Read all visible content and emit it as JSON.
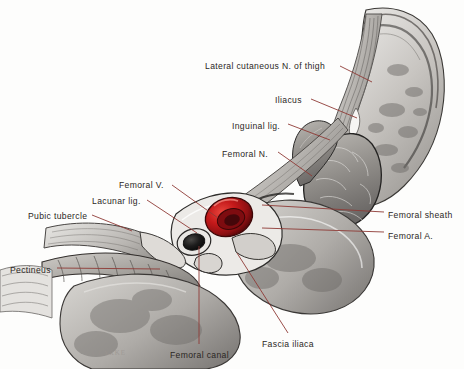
{
  "figure": {
    "background_color": "#fdfdfc",
    "leader_line_color": "#8e3a36",
    "artery_color": "#c01a18",
    "artist_signature": "CLARKE"
  },
  "labels": [
    {
      "id": "lateral-cutaneous-nerve-of-thigh",
      "text": "Lateral cutaneous N. of thigh",
      "x": 205,
      "y": 62,
      "anchor": "start",
      "leader": [
        [
          340,
          66
        ],
        [
          372,
          82
        ]
      ]
    },
    {
      "id": "iliacus",
      "text": "Iliacus",
      "x": 275,
      "y": 96,
      "anchor": "start",
      "leader": [
        [
          311,
          99
        ],
        [
          357,
          118
        ]
      ]
    },
    {
      "id": "inguinal-ligament",
      "text": "Inguinal lig.",
      "x": 232,
      "y": 122,
      "anchor": "start",
      "leader": [
        [
          288,
          124
        ],
        [
          330,
          140
        ]
      ]
    },
    {
      "id": "femoral-nerve",
      "text": "Femoral N.",
      "x": 222,
      "y": 150,
      "anchor": "start",
      "leader": [
        [
          278,
          152
        ],
        [
          312,
          176
        ]
      ]
    },
    {
      "id": "femoral-vein",
      "text": "Femoral V.",
      "x": 119,
      "y": 181,
      "anchor": "start",
      "leader": [
        [
          172,
          185
        ],
        [
          218,
          218
        ]
      ]
    },
    {
      "id": "lacunar-ligament",
      "text": "Lacunar lig.",
      "x": 92,
      "y": 197,
      "anchor": "start",
      "leader": [
        [
          147,
          200
        ],
        [
          197,
          233
        ]
      ]
    },
    {
      "id": "pubic-tubercle",
      "text": "Pubic tubercle",
      "x": 28,
      "y": 212,
      "anchor": "start",
      "leader": [
        [
          92,
          215
        ],
        [
          132,
          231
        ]
      ]
    },
    {
      "id": "pectineus",
      "text": "Pectineus",
      "x": 10,
      "y": 266,
      "anchor": "start",
      "leader": [
        [
          57,
          268
        ],
        [
          160,
          269
        ]
      ]
    },
    {
      "id": "femoral-sheath",
      "text": "Femoral sheath",
      "x": 388,
      "y": 211,
      "anchor": "start",
      "leader": [
        [
          384,
          212
        ],
        [
          262,
          205
        ]
      ]
    },
    {
      "id": "femoral-artery",
      "text": "Femoral A.",
      "x": 388,
      "y": 232,
      "anchor": "start",
      "leader": [
        [
          384,
          232
        ],
        [
          262,
          228
        ]
      ]
    },
    {
      "id": "fascia-iliaca",
      "text": "Fascia iliaca",
      "x": 262,
      "y": 340,
      "anchor": "start",
      "leader": [
        [
          288,
          333
        ],
        [
          237,
          253
        ]
      ]
    },
    {
      "id": "femoral-canal",
      "text": "Femoral canal",
      "x": 170,
      "y": 351,
      "anchor": "start",
      "leader": [
        [
          199,
          344
        ],
        [
          199,
          246
        ]
      ]
    }
  ]
}
